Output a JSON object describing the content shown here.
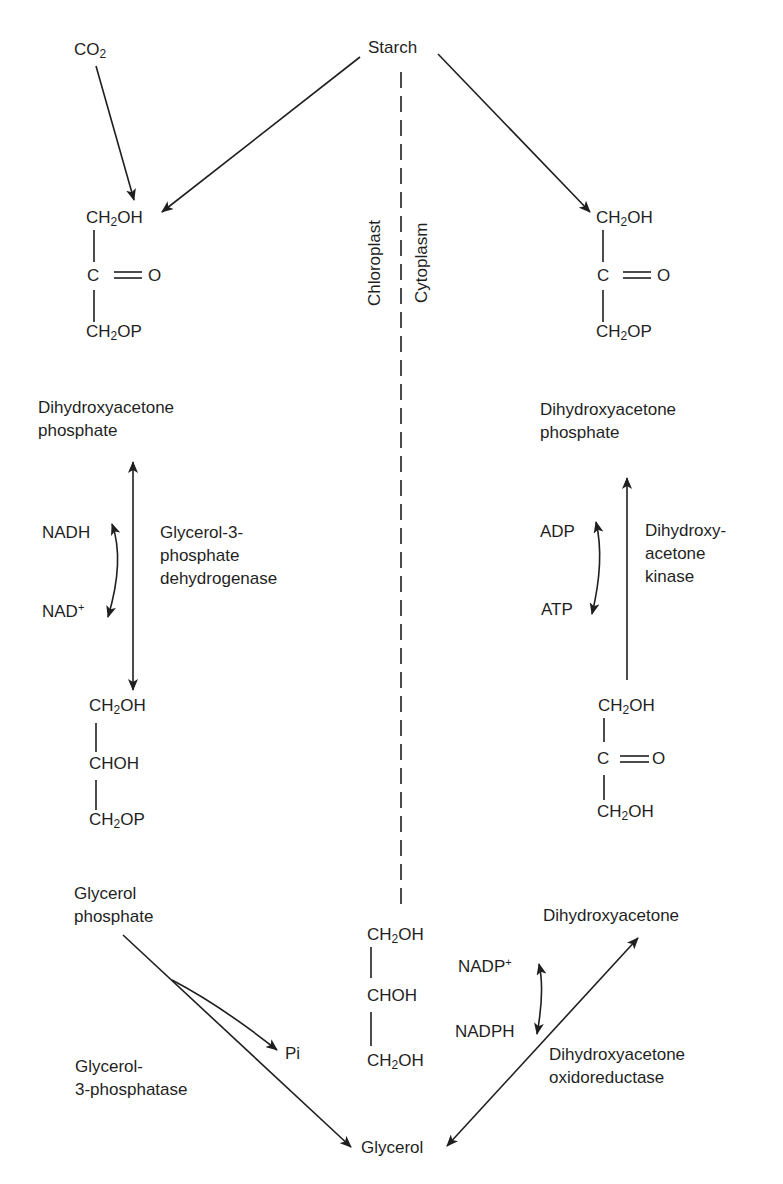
{
  "diagram": {
    "type": "metabolic-pathway",
    "compartments": {
      "left": "Chloroplast",
      "right": "Cytoplasm"
    },
    "nodes": {
      "co2": {
        "main": "CO",
        "sub": "2"
      },
      "starch": "Starch",
      "left_dhap": {
        "row1": {
          "pre": "CH",
          "sub": "2",
          "post": "OH"
        },
        "row2": {
          "c": "C",
          "o": "O"
        },
        "row3": {
          "pre": "CH",
          "sub": "2",
          "post": "OP"
        },
        "name_line1": "Dihydroxyacetone",
        "name_line2": "phosphate"
      },
      "left_g3p": {
        "row1": {
          "pre": "CH",
          "sub": "2",
          "post": "OH"
        },
        "row2": "CHOH",
        "row3": {
          "pre": "CH",
          "sub": "2",
          "post": "OP"
        },
        "name_line1": "Glycerol",
        "name_line2": "phosphate"
      },
      "right_dhap": {
        "row1": {
          "pre": "CH",
          "sub": "2",
          "post": "OH"
        },
        "row2": {
          "c": "C",
          "o": "O"
        },
        "row3": {
          "pre": "CH",
          "sub": "2",
          "post": "OP"
        },
        "name_line1": "Dihydroxyacetone",
        "name_line2": "phosphate"
      },
      "right_dha": {
        "row1": {
          "pre": "CH",
          "sub": "2",
          "post": "OH"
        },
        "row2": {
          "c": "C",
          "o": "O"
        },
        "row3": {
          "pre": "CH",
          "sub": "2",
          "post": "OH"
        },
        "name": "Dihydroxyacetone"
      },
      "glycerol": {
        "row1": {
          "pre": "CH",
          "sub": "2",
          "post": "OH"
        },
        "row2": "CHOH",
        "row3": {
          "pre": "CH",
          "sub": "2",
          "post": "OH"
        },
        "name": "Glycerol"
      },
      "pi": "Pi"
    },
    "cofactors": {
      "nadh": "NADH",
      "nad_plus": {
        "main": "NAD",
        "sup": "+"
      },
      "adp": "ADP",
      "atp": "ATP",
      "nadp_plus": {
        "main": "NADP",
        "sup": "+"
      },
      "nadph": "NADPH"
    },
    "enzymes": {
      "g3p_dehydrogenase": [
        "Glycerol-3-",
        "phosphate",
        "dehydrogenase"
      ],
      "dha_kinase": [
        "Dihydroxy-",
        "acetone",
        "kinase"
      ],
      "g3_phosphatase": [
        "Glycerol-",
        "3-phosphatase"
      ],
      "dha_oxidoreductase": [
        "Dihydroxyacetone",
        "oxidoreductase"
      ]
    },
    "edges": [
      {
        "from": "CO2",
        "to": "left DHAP",
        "type": "irreversible"
      },
      {
        "from": "Starch",
        "to": "left DHAP",
        "type": "irreversible"
      },
      {
        "from": "Starch",
        "to": "right DHAP",
        "type": "irreversible"
      },
      {
        "from": "left DHAP",
        "to": "Glycerol phosphate",
        "type": "reversible",
        "enzyme": "Glycerol-3-phosphate dehydrogenase"
      },
      {
        "from": "Glycerol phosphate",
        "to": "Glycerol",
        "type": "irreversible",
        "enzyme": "Glycerol-3-phosphatase",
        "side_product": "Pi"
      },
      {
        "from": "Glycerol",
        "to": "Dihydroxyacetone",
        "type": "reversible",
        "enzyme": "Dihydroxyacetone oxidoreductase"
      },
      {
        "from": "Dihydroxyacetone",
        "to": "right DHAP",
        "type": "irreversible",
        "enzyme": "Dihydroxyacetone kinase"
      }
    ],
    "colors": {
      "ink": "#1f1f1f",
      "background": "#ffffff"
    }
  }
}
